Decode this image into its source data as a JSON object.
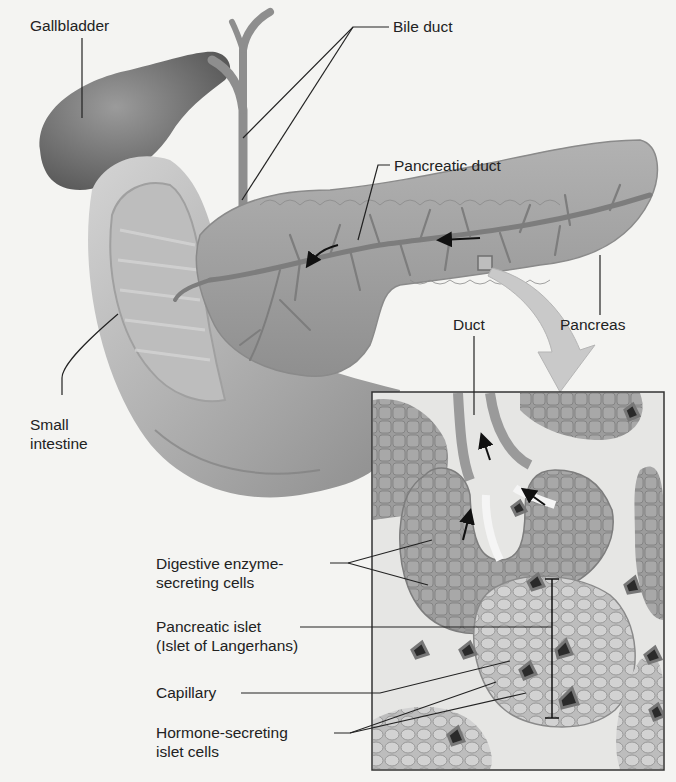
{
  "figure": {
    "colors": {
      "background": "#f4f4f2",
      "organ_gray": "#9a9a9a",
      "duct_gray": "#8a8a8a",
      "leader_line": "#222222",
      "zoom_arrow": "#c9c9c9",
      "capillary": "#2a2a2a"
    }
  },
  "labels": {
    "gallbladder": "Gallbladder",
    "bile_duct": "Bile duct",
    "pancreatic_duct": "Pancreatic duct",
    "small_intestine": "Small\nintestine",
    "duct": "Duct",
    "pancreas": "Pancreas",
    "digestive_cells": "Digestive enzyme-\nsecreting cells",
    "pancreatic_islet": "Pancreatic islet\n(Islet of Langerhans)",
    "capillary": "Capillary",
    "hormone_cells": "Hormone-secreting\nislet cells"
  },
  "inset": {
    "description": "Magnified tissue inset",
    "x": 372,
    "y": 392,
    "width": 292,
    "height": 378
  }
}
